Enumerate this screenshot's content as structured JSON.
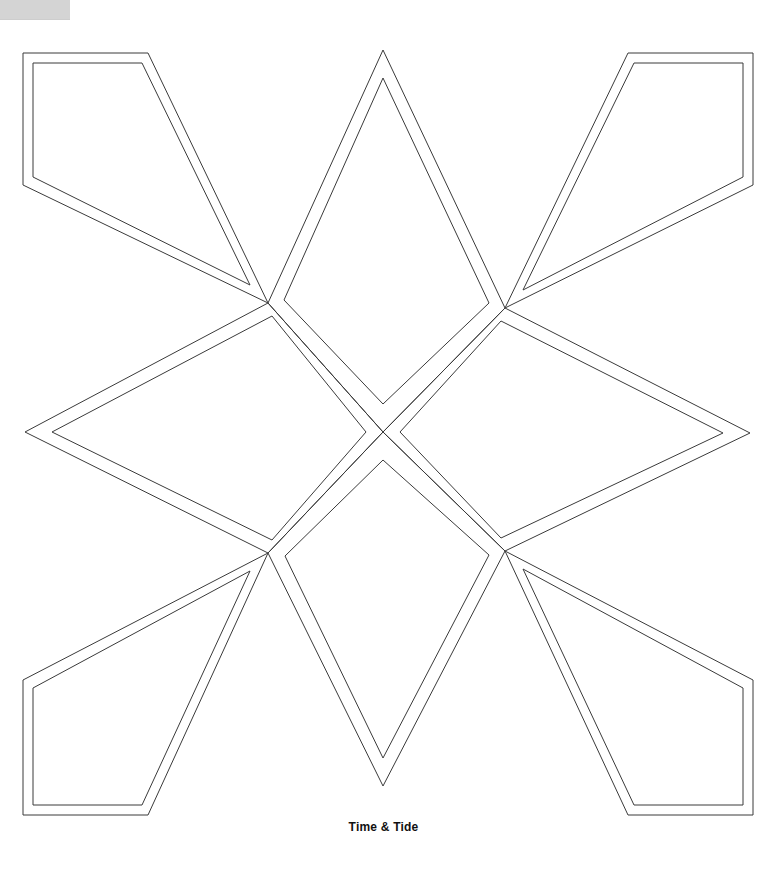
{
  "page": {
    "width": 767,
    "height": 881,
    "background_color": "#ffffff",
    "caption": "Time & Tide"
  },
  "artifact": {
    "name": "scan-edge-block",
    "color": "#d4d4d4"
  },
  "pattern": {
    "title": "Time & Tide",
    "type": "eight-pointed-star-template",
    "stroke_color": "#3a3a3a",
    "stroke_width": 1,
    "fill": "none",
    "inner_offset": 9,
    "center": [
      383,
      432
    ],
    "nodes": {
      "top_tip": [
        383,
        50
      ],
      "bottom_tip": [
        383,
        786
      ],
      "left_tip": [
        25,
        432
      ],
      "right_tip": [
        750,
        433
      ],
      "upper_left_node": [
        268,
        303
      ],
      "upper_right_node": [
        505,
        308
      ],
      "lower_left_node": [
        268,
        553
      ],
      "lower_right_node": [
        505,
        551
      ],
      "center_cross": [
        383,
        432
      ]
    },
    "shapes": [
      {
        "name": "diamond-top",
        "role": "star-point",
        "outer": "383,50 505,308 383,432 268,303",
        "inner": "383,78 489,303 383,404 284,300"
      },
      {
        "name": "diamond-bottom",
        "role": "star-point",
        "outer": "383,786 268,553 383,432 505,551",
        "inner": "383,758 285,556 383,460 489,555"
      },
      {
        "name": "diamond-left",
        "role": "star-point",
        "outer": "25,432 268,303 383,432 268,553",
        "inner": "52,432 272,316 366,432 272,540"
      },
      {
        "name": "diamond-right",
        "role": "star-point",
        "outer": "750,433 505,308 383,432 505,551",
        "inner": "723,433 501,321 400,432 501,538"
      },
      {
        "name": "kite-top-left",
        "role": "corner-panel",
        "outer": "23,53 148,53 268,303 23,185",
        "inner": "33,63 142,63 250,285 33,177"
      },
      {
        "name": "kite-top-right",
        "role": "corner-panel",
        "outer": "628,53 753,53 753,185 505,308",
        "inner": "634,63 743,63 743,177 523,290"
      },
      {
        "name": "kite-bottom-left",
        "role": "corner-panel",
        "outer": "268,553 148,815 23,815 23,680",
        "inner": "250,571 142,805 33,805 33,688"
      },
      {
        "name": "kite-bottom-right",
        "role": "corner-panel",
        "outer": "505,551 753,680 753,815 628,815",
        "inner": "523,569 743,688 743,805 634,805"
      }
    ]
  }
}
